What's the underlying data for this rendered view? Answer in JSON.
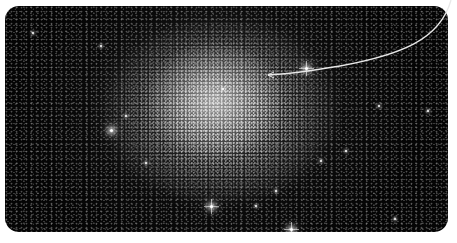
{
  "image": {
    "subject": "globular star cluster",
    "background_color": "#ffffff",
    "panel_color": "#050505",
    "star_color": "#ffffff"
  },
  "annotation": {
    "type": "curved-pointer-line",
    "color": "#e8e8e8",
    "start": [
      451,
      0
    ],
    "end": [
      268,
      75
    ]
  },
  "bright_stars": [
    {
      "x": 305,
      "y": 67,
      "size": "big",
      "spike": true
    },
    {
      "x": 110,
      "y": 129,
      "size": "big",
      "spike": false
    },
    {
      "x": 125,
      "y": 115,
      "size": "med",
      "spike": false
    },
    {
      "x": 210,
      "y": 205,
      "size": "big",
      "spike": true
    },
    {
      "x": 290,
      "y": 228,
      "size": "big",
      "spike": true
    },
    {
      "x": 222,
      "y": 88,
      "size": "med",
      "spike": false
    },
    {
      "x": 378,
      "y": 105,
      "size": "med",
      "spike": false
    },
    {
      "x": 32,
      "y": 32,
      "size": "med",
      "spike": false
    },
    {
      "x": 427,
      "y": 110,
      "size": "med",
      "spike": false
    },
    {
      "x": 255,
      "y": 205,
      "size": "med",
      "spike": false
    },
    {
      "x": 345,
      "y": 150,
      "size": "med",
      "spike": false
    },
    {
      "x": 145,
      "y": 162,
      "size": "med",
      "spike": false
    },
    {
      "x": 320,
      "y": 160,
      "size": "med",
      "spike": false
    },
    {
      "x": 394,
      "y": 218,
      "size": "med",
      "spike": false
    },
    {
      "x": 100,
      "y": 45,
      "size": "med",
      "spike": false
    },
    {
      "x": 275,
      "y": 190,
      "size": "med",
      "spike": false
    }
  ]
}
